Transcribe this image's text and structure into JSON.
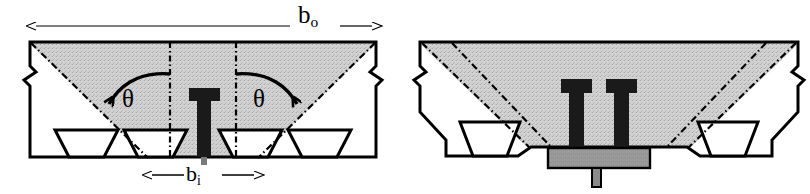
{
  "figure": {
    "type": "engineering-cross-section-drawing",
    "background_color": "#ffffff",
    "line_color": "#000000",
    "hatch_fill_color": "#cccccc",
    "bolt_color": "#1a1a1a",
    "plate_color": "#8c8c8c"
  },
  "labels": {
    "b_outer": {
      "base": "b",
      "sub": "o",
      "text": "b_o"
    },
    "b_inner": {
      "base": "b",
      "sub": "i",
      "text": "b_i"
    },
    "theta_left": "θ",
    "theta_right": "θ"
  },
  "views": [
    {
      "name": "left-view",
      "title": "T-slot table section with single T-bolt",
      "features": [
        "rectangular body outline with break symbols at both ends",
        "shaded load distribution cone between dash-dot lines",
        "two V-shaped (dovetail) slots in bottom face",
        "single T-head bolt on centerline",
        "b_o overall width dimension with double arrow",
        "b_i inner width dimension with double arrow",
        "two theta angle arcs with arrowheads"
      ],
      "bolt_count": 1
    },
    {
      "name": "right-view",
      "title": "Chamfered table section with twin T-bolts and clamping plate",
      "features": [
        "chamfered octagonal body outline with break symbols at both ends",
        "shaded trapezoidal load distribution zone bounded by dash-dot lines",
        "two V-shaped (dovetail) slots in bottom face",
        "twin T-head bolts",
        "grey clamping plate beneath bolts",
        "grey locating pin below plate"
      ],
      "bolt_count": 2
    }
  ]
}
